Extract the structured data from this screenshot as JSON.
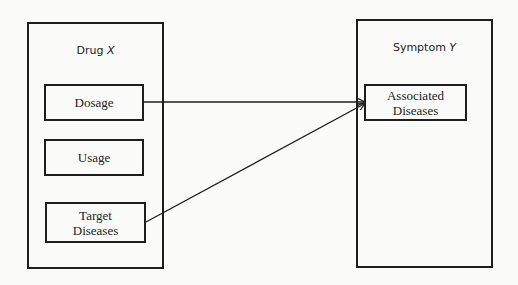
{
  "diagram": {
    "left_group": {
      "title_prefix": "Drug ",
      "title_var": "X",
      "items": [
        {
          "label": "Dosage"
        },
        {
          "label": "Usage"
        },
        {
          "label": "Target Diseases"
        }
      ]
    },
    "right_group": {
      "title_prefix": "Symptom ",
      "title_var": "Y",
      "items": [
        {
          "label": "Associated Diseases"
        }
      ]
    },
    "edges": [
      {
        "from": "Dosage",
        "to": "Associated Diseases"
      },
      {
        "from": "Target Diseases",
        "to": "Associated Diseases"
      }
    ],
    "colors": {
      "stroke": "#1e1e1e",
      "background": "#fbfbf9"
    }
  }
}
